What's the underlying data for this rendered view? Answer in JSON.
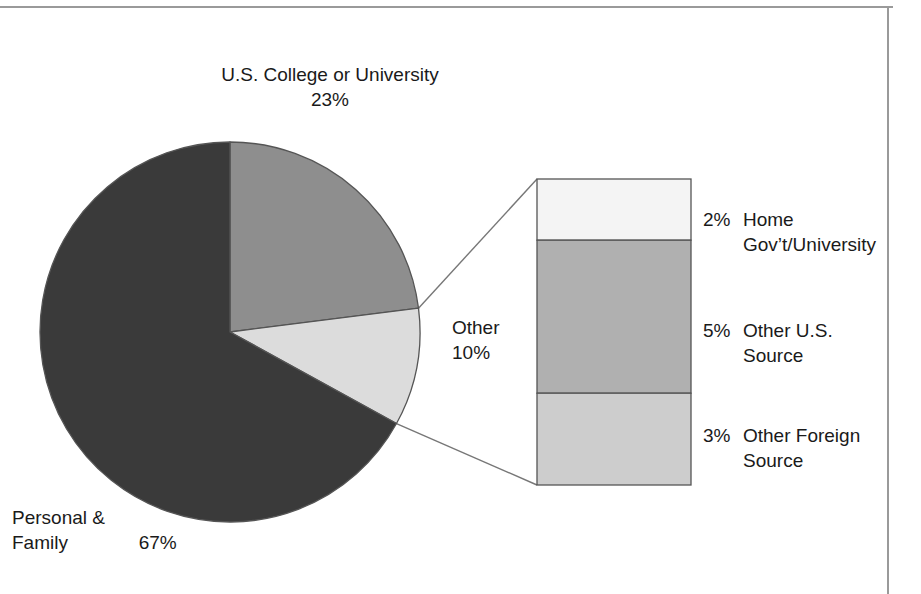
{
  "chart_data": {
    "type": "pie",
    "title": "",
    "subtitle": "",
    "xlabel": "",
    "ylabel": "",
    "grid": false,
    "legend_position": "none",
    "units": "percent",
    "categories": [
      "Personal & Family",
      "U.S. College or University",
      "Other"
    ],
    "values": [
      67,
      23,
      10
    ],
    "slices": [
      {
        "name": "Personal & Family",
        "value": 67,
        "label_line1": "Personal &",
        "label_line2": "Family",
        "value_label": "67%",
        "color": "#3a3a3a"
      },
      {
        "name": "U.S. College or University",
        "value": 23,
        "label_line1": "U.S. College or University",
        "label_line2": "",
        "value_label": "23%",
        "color": "#8e8e8e"
      },
      {
        "name": "Other",
        "value": 10,
        "label_line1": "Other",
        "label_line2": "",
        "value_label": "10%",
        "color": "#dcdcdc"
      }
    ],
    "breakout": {
      "type": "bar",
      "orientation": "vertical-stacked",
      "source_slice": "Other",
      "total": 10,
      "categories": [
        "Home Gov’t/University",
        "Other U.S. Source",
        "Other Foreign Source"
      ],
      "values": [
        2,
        5,
        3
      ],
      "segments": [
        {
          "name": "Home Gov’t/University",
          "value": 2,
          "value_label": "2%",
          "label_line1": "Home",
          "label_line2": "Gov’t/University",
          "color": "#f4f4f4"
        },
        {
          "name": "Other U.S. Source",
          "value": 5,
          "value_label": "5%",
          "label_line1": "Other U.S.",
          "label_line2": "Source",
          "color": "#b0b0b0"
        },
        {
          "name": "Other Foreign Source",
          "value": 3,
          "value_label": "3%",
          "label_line1": "Other Foreign",
          "label_line2": "Source",
          "color": "#cdcdcd"
        }
      ]
    }
  },
  "colors": {
    "outline": "#555555",
    "frame_rule": "#9a9a9a",
    "leader_line": "#777777",
    "text": "#1a1a1a",
    "background": "#ffffff"
  }
}
